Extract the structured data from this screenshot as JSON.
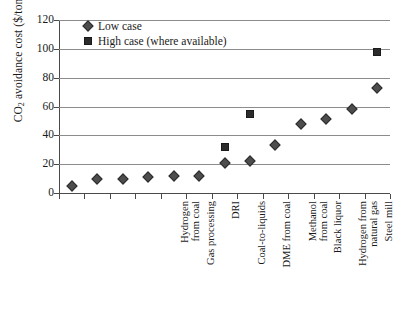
{
  "chart_data": {
    "type": "scatter",
    "title": "",
    "xlabel": "",
    "ylabel": "CO2 avoidance cost ($/tonne)",
    "ylabel_prefix": "CO",
    "ylabel_sub": "2",
    "ylabel_suffix": " avoidance cost ($/tonne)",
    "ylim": [
      0,
      120
    ],
    "yticks": [
      0,
      20,
      40,
      60,
      80,
      100,
      120
    ],
    "ytick_labels": [
      "0",
      "20",
      "40",
      "60",
      "80",
      "100",
      "120"
    ],
    "grid": true,
    "legend_position": "top-left",
    "categories": [
      "Hydrogen\nfrom coal",
      "Gas processing",
      "DRI",
      "Coal-to-liquids",
      "DME from coal",
      "Methanol\nfrom coal",
      "Black liquor",
      "Hydrogen from\nnatural gas",
      "Steel mill",
      "Oil refining",
      "Ethanol",
      "Biomass synfuels",
      "Cement"
    ],
    "series": [
      {
        "name": "Low case",
        "marker": "diamond",
        "color": "#4d4d4d",
        "values": [
          5,
          10,
          10,
          11,
          12,
          12,
          21,
          22,
          33,
          48,
          51,
          58,
          73
        ]
      },
      {
        "name": "High case (where available)",
        "marker": "square",
        "color": "#2b2b2b",
        "values": [
          null,
          null,
          null,
          null,
          null,
          null,
          32,
          55,
          null,
          null,
          null,
          null,
          98
        ]
      }
    ]
  },
  "legend": {
    "items": [
      {
        "label": "Low case",
        "marker": "diamond-marker"
      },
      {
        "label": "High case (where available)",
        "marker": "square-marker"
      }
    ]
  }
}
